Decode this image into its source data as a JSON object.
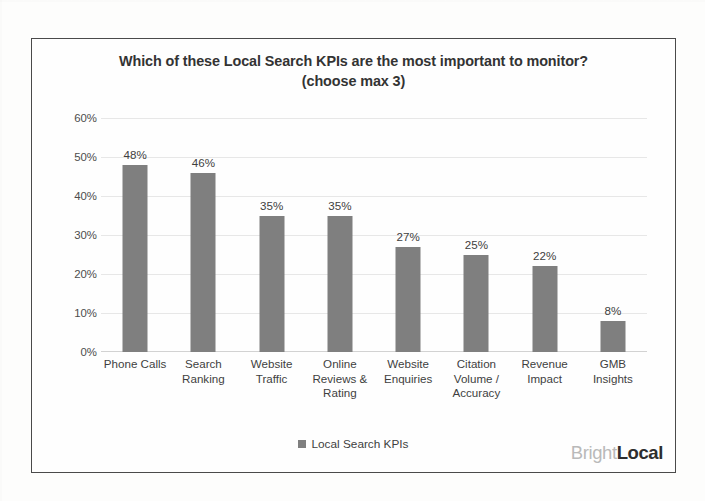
{
  "chart_data": {
    "type": "bar",
    "title": "Which of these Local Search KPIs are the most important to monitor?",
    "subtitle": "(choose max 3)",
    "categories": [
      "Phone Calls",
      "Search Ranking",
      "Website Traffic",
      "Online Reviews & Rating",
      "Website Enquiries",
      "Citation Volume / Accuracy",
      "Revenue Impact",
      "GMB Insights"
    ],
    "category_lines": [
      [
        "Phone Calls"
      ],
      [
        "Search",
        "Ranking"
      ],
      [
        "Website",
        "Traffic"
      ],
      [
        "Online",
        "Reviews &",
        "Rating"
      ],
      [
        "Website",
        "Enquiries"
      ],
      [
        "Citation",
        "Volume /",
        "Accuracy"
      ],
      [
        "Revenue",
        "Impact"
      ],
      [
        "GMB",
        "Insights"
      ]
    ],
    "values": [
      48,
      46,
      35,
      35,
      27,
      25,
      22,
      8
    ],
    "value_labels": [
      "48%",
      "46%",
      "35%",
      "35%",
      "27%",
      "25%",
      "22%",
      "8%"
    ],
    "xlabel": "",
    "ylabel": "",
    "ylim": [
      0,
      60
    ],
    "ytick_values": [
      0,
      10,
      20,
      30,
      40,
      50,
      60
    ],
    "ytick_labels": [
      "0%",
      "10%",
      "20%",
      "30%",
      "40%",
      "50%",
      "60%"
    ],
    "grid": true,
    "legend": {
      "position": "bottom",
      "entries": [
        "Local Search KPIs"
      ]
    },
    "series": [
      {
        "name": "Local Search KPIs",
        "values": [
          48,
          46,
          35,
          35,
          27,
          25,
          22,
          8
        ]
      }
    ],
    "colors": {
      "bar": "#7f7f7f",
      "gridline": "#e7e7e7",
      "text": "#3f3f3f",
      "frame": "#4a4a4a"
    }
  },
  "brand": {
    "part1": "Bright",
    "part2": "Local"
  }
}
